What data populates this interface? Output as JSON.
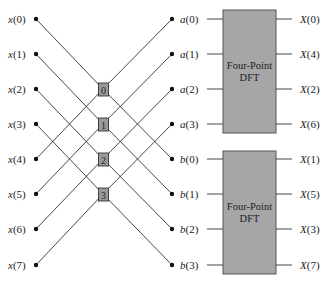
{
  "diagram": {
    "type": "decimation-in-frequency butterfly (8-point FFT first stage)",
    "inputs": [
      "x(0)",
      "x(1)",
      "x(2)",
      "x(3)",
      "x(4)",
      "x(5)",
      "x(6)",
      "x(7)"
    ],
    "butterflies": [
      "0",
      "1",
      "2",
      "3"
    ],
    "intermediate_a": [
      "a(0)",
      "a(1)",
      "a(2)",
      "a(3)"
    ],
    "intermediate_b": [
      "b(0)",
      "b(1)",
      "b(2)",
      "b(3)"
    ],
    "dft_blocks": [
      {
        "line1": "Four-Point",
        "line2": "DFT",
        "outputs": [
          "X(0)",
          "X(4)",
          "X(2)",
          "X(6)"
        ]
      },
      {
        "line1": "Four-Point",
        "line2": "DFT",
        "outputs": [
          "X(1)",
          "X(5)",
          "X(3)",
          "X(7)"
        ]
      }
    ],
    "colors": {
      "line": "#333333",
      "dot": "#111111",
      "block_fill": "#a6a6a6",
      "block_stroke": "#555555",
      "butterfly_fill": "#9a9a9a"
    }
  }
}
